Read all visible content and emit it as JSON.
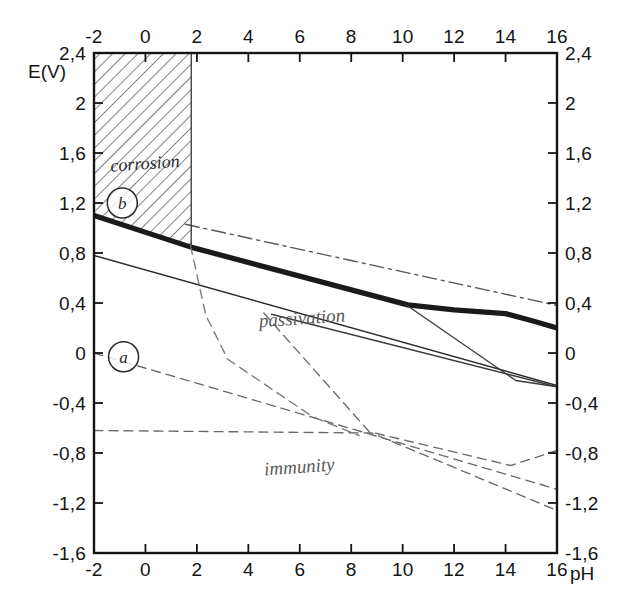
{
  "figure": {
    "kind": "pourbaix-diagram",
    "background": "#ffffff",
    "ink": "#141414"
  },
  "axes": {
    "x_label_bottom": "pH",
    "y_label_left": "E(V)",
    "x_ticks": [
      "-2",
      "0",
      "2",
      "4",
      "6",
      "8",
      "10",
      "12",
      "14",
      "16"
    ],
    "x_tick_values": [
      -2,
      0,
      2,
      4,
      6,
      8,
      10,
      12,
      14,
      16
    ],
    "y_ticks": [
      "2,4",
      "2",
      "1,6",
      "1,2",
      "0,8",
      "0,4",
      "0",
      "-0,4",
      "-0,8",
      "-1,2",
      "-1,6"
    ],
    "y_tick_values": [
      2.4,
      2.0,
      1.6,
      1.2,
      0.8,
      0.4,
      0.0,
      -0.4,
      -0.8,
      -1.2,
      -1.6
    ],
    "xlim": [
      -2,
      16
    ],
    "ylim": [
      -1.6,
      2.4
    ],
    "x_ticks_top": [
      "-2",
      "0",
      "2",
      "4",
      "6",
      "8",
      "10",
      "12",
      "14",
      "16"
    ],
    "y_ticks_right": [
      "2,4",
      "2",
      "1,6",
      "1,2",
      "0,8",
      "0,4",
      "0",
      "-0,4",
      "-0,8",
      "-1,2",
      "-1,6"
    ]
  },
  "region_labels": [
    {
      "name": "corrosion",
      "text": "corrosion",
      "x": 0.0,
      "y": 1.47
    },
    {
      "name": "passivation",
      "text": "passivation",
      "x": 6.1,
      "y": 0.23
    },
    {
      "name": "immunity",
      "text": "immunity",
      "x": 6.0,
      "y": -0.96
    }
  ],
  "markers": [
    {
      "name": "line-b-marker",
      "text": "b",
      "x": -0.9,
      "y": 1.2
    },
    {
      "name": "line-a-marker",
      "text": "a",
      "x": -0.85,
      "y": -0.03
    }
  ],
  "chart_data": {
    "type": "line",
    "title": "",
    "xlabel": "pH",
    "ylabel": "E(V)",
    "xlim": [
      -2,
      16
    ],
    "ylim": [
      -1.6,
      2.4
    ],
    "grid": false,
    "legend": null,
    "shaded_regions": [
      {
        "name": "corrosion-hatched",
        "label": "corrosion",
        "hatch": "diagonal",
        "x_range": [
          -2.0,
          1.78
        ],
        "y_top": 2.4,
        "y_bottom_line": "passivation-boundary-thick"
      }
    ],
    "series": [
      {
        "name": "passivation-boundary-thick",
        "style": "solid",
        "width": "thick",
        "color": "#1a1a1a",
        "points": [
          [
            -2.0,
            1.1
          ],
          [
            1.8,
            0.845
          ],
          [
            10.2,
            0.385
          ],
          [
            12.0,
            0.345
          ],
          [
            14.0,
            0.315
          ],
          [
            15.0,
            0.26
          ],
          [
            16.0,
            0.2
          ]
        ]
      },
      {
        "name": "upper-dash-dot-boundary",
        "style": "dashdot",
        "width": "thin",
        "color": "#555555",
        "points": [
          [
            1.55,
            1.03
          ],
          [
            8.0,
            0.74
          ],
          [
            16.0,
            0.38
          ]
        ]
      },
      {
        "name": "lower-solid-boundary",
        "style": "solid",
        "width": "thin",
        "color": "#2b2b2b",
        "points": [
          [
            -2.0,
            0.78
          ],
          [
            16.0,
            -0.26
          ]
        ]
      },
      {
        "name": "passivation-inner-solid",
        "style": "solid",
        "width": "thin",
        "color": "#3a3a3a",
        "points": [
          [
            4.9,
            0.31
          ],
          [
            16.0,
            -0.27
          ]
        ]
      },
      {
        "name": "steep-solid-descender",
        "style": "solid",
        "width": "thin",
        "color": "#3a3a3a",
        "points": [
          [
            10.1,
            0.39
          ],
          [
            14.4,
            -0.22
          ],
          [
            16.0,
            -0.27
          ]
        ]
      },
      {
        "name": "line-a-dashed",
        "style": "dashed",
        "width": "thin",
        "color": "#6a6a6a",
        "points": [
          [
            -2.0,
            0.0
          ],
          [
            16.0,
            -1.09
          ]
        ]
      },
      {
        "name": "immunity-upper-dashed",
        "style": "dashed",
        "width": "thin",
        "color": "#6a6a6a",
        "points": [
          [
            -2.0,
            -0.62
          ],
          [
            8.8,
            -0.64
          ],
          [
            16.0,
            -1.26
          ]
        ]
      },
      {
        "name": "vertical-dashed-drop",
        "style": "dashed",
        "width": "thin",
        "color": "#7a7a7a",
        "points": [
          [
            1.75,
            0.86
          ],
          [
            2.35,
            0.3
          ],
          [
            3.2,
            -0.05
          ],
          [
            6.5,
            -0.51
          ],
          [
            8.3,
            -0.66
          ]
        ]
      },
      {
        "name": "descending-dashed-to-corner",
        "style": "dashed",
        "width": "thin",
        "color": "#6a6a6a",
        "points": [
          [
            4.6,
            0.32
          ],
          [
            8.7,
            -0.63
          ],
          [
            14.2,
            -0.9
          ],
          [
            16.0,
            -0.78
          ]
        ]
      },
      {
        "name": "corrosion-right-edge",
        "style": "solid",
        "width": "thin",
        "color": "#3a3a3a",
        "points": [
          [
            1.78,
            2.4
          ],
          [
            1.78,
            0.845
          ]
        ]
      }
    ]
  }
}
